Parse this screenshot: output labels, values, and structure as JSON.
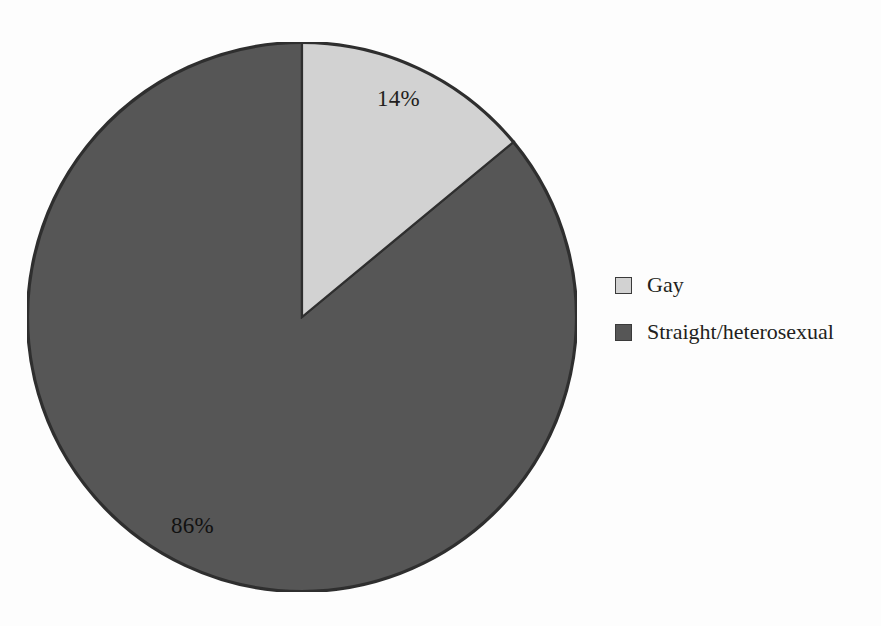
{
  "chart_data": {
    "type": "pie",
    "title": "",
    "subtitle": "",
    "xlabel": "",
    "ylabel": "",
    "categories": [
      "Gay",
      "Straight/heterosexual"
    ],
    "values": [
      14,
      86
    ],
    "value_unit": "%",
    "data_labels": [
      "14%",
      "86%"
    ],
    "slices": [
      {
        "label": "Gay",
        "value": 14,
        "data_label": "14%",
        "color": "#d2d2d2",
        "start_angle_deg": 0,
        "end_angle_deg": 50.4
      },
      {
        "label": "Straight/heterosexual",
        "value": 86,
        "data_label": "86%",
        "color": "#565656",
        "start_angle_deg": 50.4,
        "end_angle_deg": 360
      }
    ],
    "start_angle": "12 o'clock",
    "direction": "clockwise",
    "grid": false,
    "legend_position": "right",
    "legend_entries": [
      {
        "label": "Gay",
        "color": "#d2d2d2"
      },
      {
        "label": "Straight/heterosexual",
        "color": "#565656"
      }
    ]
  },
  "figure": {
    "background_color": "#fdfdfd",
    "outline_color": "#2f2f2f"
  },
  "labels": {
    "gay_percent": "14%",
    "straight_percent": "86%"
  },
  "legend": {
    "items": [
      {
        "label": "Gay",
        "swatch_color": "#d2d2d2",
        "swatch_border": "#3a3a3a"
      },
      {
        "label": "Straight/heterosexual",
        "swatch_color": "#565656",
        "swatch_border": "#3a3a3a"
      }
    ]
  }
}
